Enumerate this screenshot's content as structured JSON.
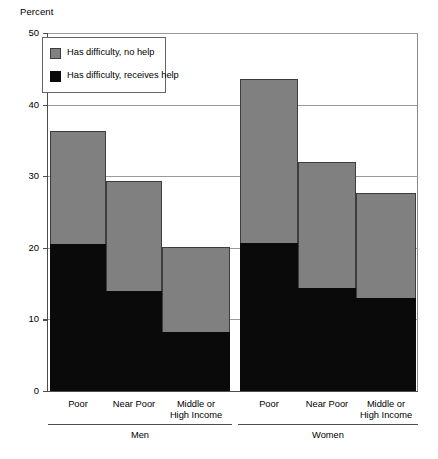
{
  "chart_data": {
    "type": "bar",
    "title": "",
    "subtitle": "",
    "xlabel": "",
    "ylabel": "Percent",
    "ylim": [
      0,
      50
    ],
    "yticks": [
      0,
      10,
      20,
      30,
      40,
      50
    ],
    "ytick_labels": [
      "0",
      "10",
      "20",
      "30",
      "40",
      "50"
    ],
    "grid": true,
    "stacked": true,
    "legend_position": "upper-left-inside",
    "legend": [
      "Has difficulty, no help",
      "Has difficulty, receives help"
    ],
    "categories": [
      "Poor",
      "Near Poor",
      "Middle or High Income",
      "Poor",
      "Near Poor",
      "Middle or High Income"
    ],
    "groups": [
      "Men",
      "Women"
    ],
    "group_spans": [
      3,
      3
    ],
    "series": [
      {
        "name": "Has difficulty, receives help",
        "color": "#0a0a0a",
        "values": [
          20.5,
          14.0,
          8.2,
          20.7,
          14.4,
          13.0
        ]
      },
      {
        "name": "Has difficulty, no help",
        "color": "#808080",
        "values": [
          15.8,
          15.3,
          11.9,
          22.9,
          17.6,
          14.7
        ]
      }
    ],
    "totals": [
      36.3,
      29.3,
      20.1,
      43.6,
      32.0,
      27.7
    ]
  },
  "axis": {
    "y_title": "Percent"
  },
  "bars": [
    {
      "label": "Poor",
      "label_lines": [
        "Poor"
      ],
      "group": "Men",
      "total": 36.3,
      "black": 20.5,
      "gray": 15.8
    },
    {
      "label": "Near Poor",
      "label_lines": [
        "Near Poor"
      ],
      "group": "Men",
      "total": 29.3,
      "black": 14.0,
      "gray": 15.3
    },
    {
      "label": "Middle or High Income",
      "label_lines": [
        "Middle or",
        "High Income"
      ],
      "group": "Men",
      "total": 20.1,
      "black": 8.2,
      "gray": 11.9
    },
    {
      "label": "Poor",
      "label_lines": [
        "Poor"
      ],
      "group": "Women",
      "total": 43.6,
      "black": 20.7,
      "gray": 22.9
    },
    {
      "label": "Near Poor",
      "label_lines": [
        "Near Poor"
      ],
      "group": "Women",
      "total": 32.0,
      "black": 14.4,
      "gray": 17.6
    },
    {
      "label": "Middle or High Income",
      "label_lines": [
        "Middle or",
        "High Income"
      ],
      "group": "Women",
      "total": 27.7,
      "black": 13.0,
      "gray": 14.7
    }
  ],
  "legend": {
    "items": [
      {
        "label": "Has difficulty, no help",
        "swatch": "gray"
      },
      {
        "label": "Has difficulty, receives help",
        "swatch": "black"
      }
    ]
  },
  "groups": [
    {
      "label": "Men"
    },
    {
      "label": "Women"
    }
  ],
  "yticks": [
    {
      "value": 50,
      "label": "50"
    },
    {
      "value": 40,
      "label": "40"
    },
    {
      "value": 30,
      "label": "30"
    },
    {
      "value": 20,
      "label": "20"
    },
    {
      "value": 10,
      "label": "10"
    },
    {
      "value": 0,
      "label": "0"
    }
  ]
}
